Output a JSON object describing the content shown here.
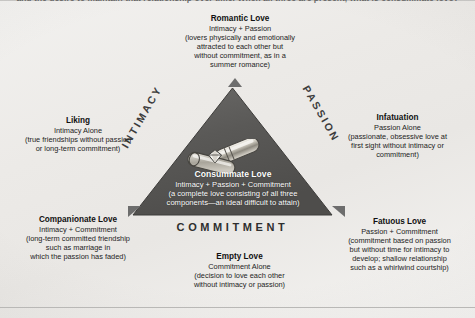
{
  "figure": {
    "name": "sternberg-triangular-theory-of-love",
    "top_cut_caption": "and the desire to maintain that relationship over time. When all three are present, what is consummate love?",
    "background_color": "#ecebe8",
    "triangle_fill_color": "#575756",
    "triangle_edge_color": "#8f8d8a",
    "text_color": "#232323",
    "inner_text_color": "#ffffff"
  },
  "triangle": {
    "side_labels": {
      "left": "INTIMACY",
      "right": "PASSION",
      "bottom": "COMMITMENT"
    },
    "center": {
      "heading": "Consummate Love",
      "formula": "Intimacy + Passion + Commitment",
      "description_line_1": "(a complete love consisting of all three",
      "description_line_2": "components—an ideal difficult to attain)"
    },
    "graphic_icon": "interlocking-wedding-rings-icon"
  },
  "callouts": {
    "romantic": {
      "heading": "Romantic Love",
      "formula": "Intimacy + Passion",
      "lines": [
        "(lovers physically and emotionally",
        "attracted to each other but",
        "without commitment, as in a",
        "summer romance)"
      ]
    },
    "liking": {
      "heading": "Liking",
      "formula": "Intimacy Alone",
      "lines": [
        "(true friendships without passion",
        "or long-term commitment)"
      ]
    },
    "infatuation": {
      "heading": "Infatuation",
      "formula": "Passion Alone",
      "lines": [
        "(passionate, obsessive love at",
        "first sight without intimacy or",
        "commitment)"
      ]
    },
    "companionate": {
      "heading": "Companionate Love",
      "formula": "Intimacy + Commitment",
      "lines": [
        "(long-term committed friendship",
        "such as marriage in",
        "which the passion has faded)"
      ]
    },
    "fatuous": {
      "heading": "Fatuous Love",
      "formula": "Passion + Commitment",
      "lines": [
        "(commitment based on passion",
        "but without time for intimacy to",
        "develop; shallow relationship",
        "such as a whirlwind courtship)"
      ]
    },
    "empty": {
      "heading": "Empty Love",
      "formula": "Commitment Alone",
      "lines": [
        "(decision to love each other",
        "without intimacy or passion)"
      ]
    }
  }
}
